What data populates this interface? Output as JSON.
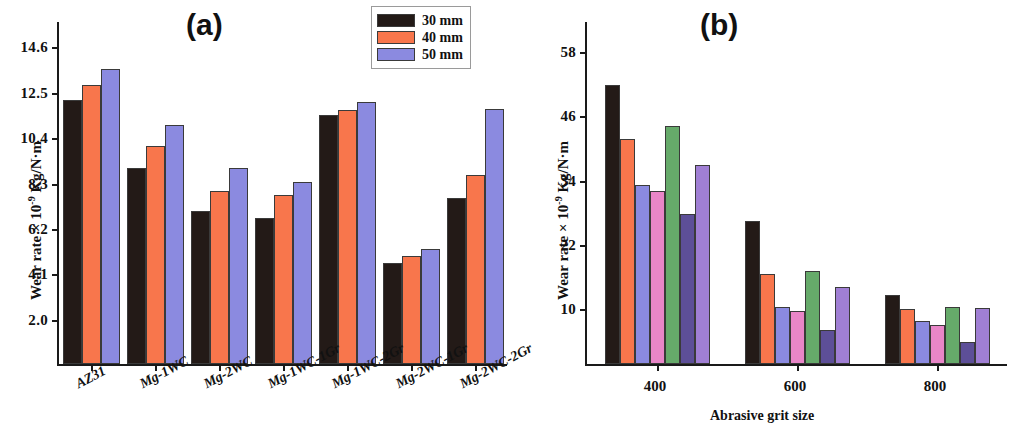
{
  "figure": {
    "panel_a": {
      "tag": "(a)",
      "ylabel_main": "Wear rate × 10",
      "ylabel_exp": "-9",
      "ylabel_unit": " Kg/N·m",
      "yticks": [
        "14.6",
        "12.5",
        "10.4",
        "8.3",
        "6.2",
        "4.1",
        "2.0"
      ],
      "legend": [
        {
          "label": "30 mm",
          "color": "#231a17"
        },
        {
          "label": "40 mm",
          "color": "#f8764c"
        },
        {
          "label": "50 mm",
          "color": "#8b8ae0"
        }
      ]
    },
    "panel_b": {
      "tag": "(b)",
      "ylabel_main": "Wear rate × 10",
      "ylabel_exp": "-9",
      "ylabel_unit": " Kg/N·m",
      "yticks": [
        "58",
        "46",
        "34",
        "22",
        "10"
      ],
      "xtitle": "Abrasive grit size",
      "legend": [
        {
          "label": "AZ31",
          "color": "#231a17"
        },
        {
          "label": "AZ31-1WC",
          "color": "#f8764c"
        },
        {
          "label": "AZ31-2WC",
          "color": "#8b8ae0"
        },
        {
          "label": "AZ31-1WC-1Gr",
          "color": "#e986c8"
        },
        {
          "label": "AZ31-1WC-2Gr",
          "color": "#66aa6a"
        },
        {
          "label": "AZ31-2WC-1Gr",
          "color": "#5d4f98"
        },
        {
          "label": "AZ31-2WC-2Gr",
          "color": "#a07fd4"
        }
      ]
    }
  },
  "chart_data": [
    {
      "type": "bar",
      "title": "(a)",
      "xlabel": "",
      "ylabel": "Wear rate × 10^-9 Kg/N·m",
      "ylim": [
        0.0,
        14.6
      ],
      "yticks": [
        2.0,
        4.1,
        6.2,
        8.3,
        10.4,
        12.5,
        14.6
      ],
      "grid": false,
      "legend_position": "top-right",
      "categories": [
        "AZ31",
        "Mg-1WC",
        "Mg-2WC",
        "Mg-1WC-1Gr",
        "Mg-1WC-2Gr",
        "Mg-2WC-1Gr",
        "Mg-2WC-2Gr"
      ],
      "series": [
        {
          "name": "30 mm",
          "color": "#231a17",
          "values": [
            12.2,
            9.05,
            7.1,
            6.75,
            11.5,
            4.65,
            7.7
          ]
        },
        {
          "name": "40 mm",
          "color": "#f8764c",
          "values": [
            12.9,
            10.1,
            8.0,
            7.8,
            11.75,
            5.0,
            8.75
          ]
        },
        {
          "name": "50 mm",
          "color": "#8b8ae0",
          "values": [
            13.65,
            11.05,
            9.05,
            8.4,
            12.1,
            5.3,
            11.8
          ]
        }
      ]
    },
    {
      "type": "bar",
      "title": "(b)",
      "xlabel": "Abrasive grit size",
      "ylabel": "Wear rate × 10^-9 Kg/N·m",
      "ylim": [
        0,
        58
      ],
      "yticks": [
        10,
        22,
        34,
        46,
        58
      ],
      "grid": false,
      "legend_position": "top-right",
      "categories": [
        "400",
        "600",
        "800"
      ],
      "series": [
        {
          "name": "AZ31",
          "color": "#231a17",
          "values": [
            52.0,
            26.7,
            12.9
          ]
        },
        {
          "name": "AZ31-1WC",
          "color": "#f8764c",
          "values": [
            42.0,
            16.8,
            10.2
          ]
        },
        {
          "name": "AZ31-2WC",
          "color": "#8b8ae0",
          "values": [
            33.4,
            10.7,
            8.0
          ]
        },
        {
          "name": "AZ31-1WC-1Gr",
          "color": "#e986c8",
          "values": [
            32.3,
            9.9,
            7.2
          ]
        },
        {
          "name": "AZ31-1WC-2Gr",
          "color": "#66aa6a",
          "values": [
            44.4,
            17.4,
            10.7
          ]
        },
        {
          "name": "AZ31-2WC-1Gr",
          "color": "#5d4f98",
          "values": [
            28.0,
            6.3,
            4.1
          ]
        },
        {
          "name": "AZ31-2WC-2Gr",
          "color": "#a07fd4",
          "values": [
            37.2,
            14.3,
            10.5
          ]
        }
      ]
    }
  ]
}
